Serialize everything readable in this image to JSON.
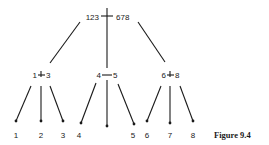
{
  "figure": {
    "caption": "Figure 9.4",
    "root": {
      "left": "123",
      "right": "678"
    },
    "middle": [
      {
        "left": "1",
        "right": "3"
      },
      {
        "left": "4",
        "right": "5"
      },
      {
        "left": "6",
        "right": "8"
      }
    ],
    "leaves": [
      "1",
      "2",
      "3",
      "4",
      "5",
      "6",
      "7",
      "8"
    ]
  }
}
